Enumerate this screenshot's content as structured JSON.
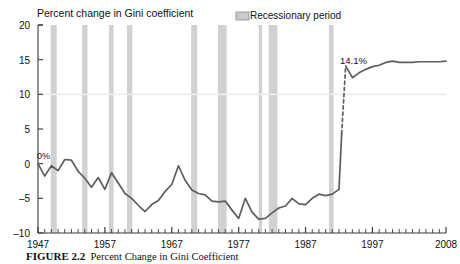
{
  "figure": {
    "caption_label": "FIGURE 2.2",
    "caption_text": "Percent Change in Gini Coefficient"
  },
  "chart_data": {
    "type": "line",
    "title": "Percent change in Gini coefficient",
    "xlabel": "",
    "ylabel": "Percent change in Gini coefficient",
    "xlim": [
      1947,
      2008
    ],
    "ylim": [
      -10,
      20
    ],
    "yticks": [
      -10,
      -5,
      0,
      5,
      10,
      15,
      20
    ],
    "ytick_labels": [
      "-10",
      "-5",
      "0",
      "5",
      "10",
      "15",
      "20"
    ],
    "xticks": [
      1947,
      1957,
      1967,
      1977,
      1987,
      1997,
      2008
    ],
    "xtick_labels": [
      "1947",
      "1957",
      "1967",
      "1977",
      "1987",
      "1997",
      "2008"
    ],
    "minor_tick_interval": 1,
    "grid": false,
    "gridline_values": [
      10
    ],
    "legend": [
      {
        "label": "Recessionary period",
        "color": "#c9c9c9",
        "marker": "band"
      }
    ],
    "annotations": [
      {
        "text": "0%",
        "x": 1947,
        "y": 0
      },
      {
        "text": "14.1%",
        "x": 1993,
        "y": 14.1
      }
    ],
    "series": [
      {
        "name": "Percent change in Gini coefficient",
        "color": "#5e5e5e",
        "style": "solid",
        "x": [
          1947,
          1948,
          1949,
          1950,
          1951,
          1952,
          1953,
          1954,
          1955,
          1956,
          1957,
          1958,
          1959,
          1960,
          1961,
          1962,
          1963,
          1964,
          1965,
          1966,
          1967,
          1968,
          1969,
          1970,
          1971,
          1972,
          1973,
          1974,
          1975,
          1976,
          1977,
          1978,
          1979,
          1980,
          1981,
          1982,
          1983,
          1984,
          1985,
          1986,
          1987,
          1988,
          1989,
          1990,
          1991,
          1992
        ],
        "y": [
          0.0,
          -1.8,
          -0.3,
          -1.0,
          0.6,
          0.5,
          -1.1,
          -2.1,
          -3.4,
          -2.0,
          -3.7,
          -1.3,
          -2.8,
          -4.3,
          -5.0,
          -6.0,
          -6.9,
          -5.9,
          -5.3,
          -4.0,
          -3.0,
          -0.3,
          -2.4,
          -3.8,
          -4.3,
          -4.5,
          -5.4,
          -5.5,
          -5.4,
          -6.7,
          -7.9,
          -5.0,
          -7.0,
          -8.0,
          -7.9,
          -7.1,
          -6.4,
          -6.1,
          -5.0,
          -5.8,
          -5.9,
          -5.0,
          -4.4,
          -4.6,
          -4.4,
          -3.7
        ]
      },
      {
        "name": "Percent change in Gini coefficient (continued)",
        "color": "#5e5e5e",
        "style": "solid",
        "x": [
          1992,
          1993,
          1994,
          1995,
          1996,
          1997,
          1998,
          1999,
          2000,
          2001,
          2002,
          2003,
          2004,
          2005,
          2006,
          2007,
          2008
        ],
        "y": [
          -3.7,
          -2.6,
          -1.3,
          0.7,
          1.0,
          2.0,
          2.4,
          3.3,
          3.6,
          4.0,
          5.0,
          5.1,
          4.7,
          5.0,
          5.0,
          5.0,
          5.0
        ]
      },
      {
        "name": "Post-1992 series (re-based)",
        "color": "#5e5e5e",
        "style": "solid",
        "x": [
          1993,
          1994,
          1995,
          1996,
          1997,
          1998,
          1999,
          2000,
          2001,
          2002,
          2003,
          2004,
          2005,
          2006,
          2007,
          2008
        ],
        "y": [
          14.1,
          12.4,
          13.1,
          13.6,
          14.0,
          14.2,
          14.6,
          14.8,
          14.6,
          14.6,
          14.6,
          14.7,
          14.7,
          14.7,
          14.7,
          14.8
        ]
      }
    ],
    "break_segment": {
      "style": "dashed",
      "x": [
        1992.4,
        1993.0
      ],
      "y": [
        4.3,
        14.1
      ],
      "note": "methodology break"
    },
    "recession_bands": [
      {
        "start": 1948.9,
        "end": 1949.8
      },
      {
        "start": 1953.6,
        "end": 1954.4
      },
      {
        "start": 1957.6,
        "end": 1958.3
      },
      {
        "start": 1960.3,
        "end": 1961.1
      },
      {
        "start": 1969.9,
        "end": 1970.8
      },
      {
        "start": 1973.9,
        "end": 1975.2
      },
      {
        "start": 1980.0,
        "end": 1980.5
      },
      {
        "start": 1981.5,
        "end": 1982.8
      },
      {
        "start": 1990.5,
        "end": 1991.2
      }
    ]
  }
}
